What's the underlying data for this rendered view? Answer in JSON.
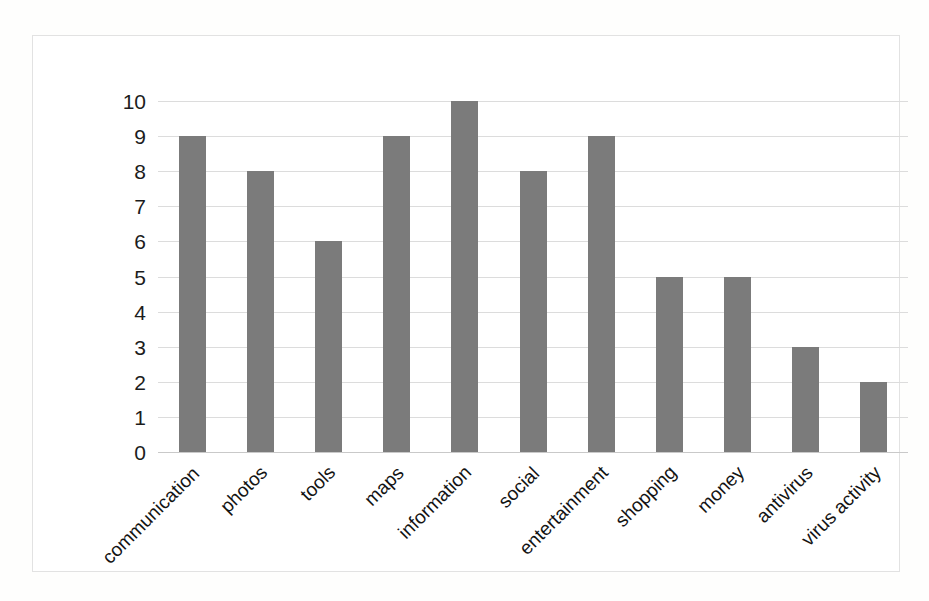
{
  "chart_data": {
    "type": "bar",
    "title": "",
    "subtitle": "",
    "xlabel": "",
    "ylabel": "",
    "ylim": [
      0,
      10
    ],
    "ytick_labels": [
      "10",
      "9",
      "8",
      "7",
      "6",
      "5",
      "4",
      "3",
      "2",
      "1",
      "0"
    ],
    "ytick_values": [
      10,
      9,
      8,
      7,
      6,
      5,
      4,
      3,
      2,
      1,
      0
    ],
    "grid": true,
    "legend": false,
    "legend_position": "none",
    "bar_color": "#7b7b7b",
    "gridline_color": "#dcdcdc",
    "frame_color": "#e2e2e2",
    "categories": [
      "communication",
      "photos",
      "tools",
      "maps",
      "information",
      "social",
      "entertainment",
      "shopping",
      "money",
      "antivirus",
      "virus activity"
    ],
    "values": [
      9,
      8,
      6,
      9,
      10,
      8,
      9,
      5,
      5,
      3,
      2
    ],
    "series": [
      {
        "name": "count",
        "values": [
          9,
          8,
          6,
          9,
          10,
          8,
          9,
          5,
          5,
          3,
          2
        ]
      }
    ],
    "label_rotation_deg": -45
  }
}
